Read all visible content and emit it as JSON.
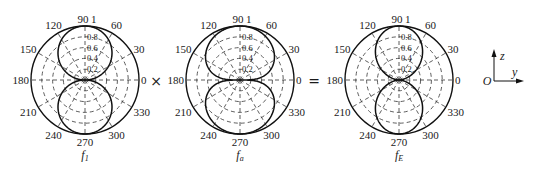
{
  "figure": {
    "operators": {
      "times": "×",
      "equals": "="
    },
    "radial_ticks": [
      "0.2",
      "0.4",
      "0.6",
      "0.8",
      "1"
    ],
    "angle_ticks": [
      "0",
      "30",
      "60",
      "90",
      "120",
      "150",
      "180",
      "210",
      "240",
      "270",
      "300",
      "330"
    ],
    "axes_indicator": {
      "origin": "O",
      "up": "z",
      "right": "y"
    }
  },
  "chart_data": [
    {
      "type": "polar",
      "title": "f1",
      "caption_main": "f",
      "caption_sub": "1",
      "radial_range": [
        0,
        1
      ],
      "radial_ticks": [
        0.2,
        0.4,
        0.6,
        0.8,
        1
      ],
      "angle_ticks_deg": [
        0,
        30,
        60,
        90,
        120,
        150,
        180,
        210,
        240,
        270,
        300,
        330
      ],
      "pattern": "|sin(theta)|",
      "exponent": 1,
      "description": "Two circular lobes along 90° and 270°, max 1, nulls at 0° and 180°"
    },
    {
      "type": "polar",
      "title": "fa",
      "caption_main": "f",
      "caption_sub": "a",
      "radial_range": [
        0,
        1
      ],
      "radial_ticks": [
        0.2,
        0.4,
        0.6,
        0.8,
        1
      ],
      "angle_ticks_deg": [
        0,
        30,
        60,
        90,
        120,
        150,
        180,
        210,
        240,
        270,
        300,
        330
      ],
      "pattern": "|sin(theta)|^0.5 (broad lobes)",
      "exponent": 0.45,
      "description": "Two broad lobes along 90° and 270°, max 1, nulls at 0° and 180°"
    },
    {
      "type": "polar",
      "title": "fE",
      "caption_main": "f",
      "caption_sub": "E",
      "radial_range": [
        0,
        1
      ],
      "radial_ticks": [
        0.2,
        0.4,
        0.6,
        0.8,
        1
      ],
      "angle_ticks_deg": [
        0,
        30,
        60,
        90,
        120,
        150,
        180,
        210,
        240,
        270,
        300,
        330
      ],
      "pattern": "f1 × fa",
      "exponent": 1.45,
      "description": "Product pattern: narrower lobes along 90° and 270°, max 1, nulls at 0° and 180°"
    }
  ]
}
